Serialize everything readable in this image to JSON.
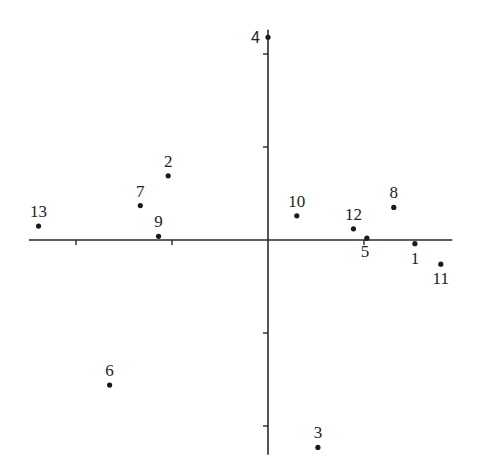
{
  "chart_data": {
    "type": "scatter",
    "title": "",
    "xlabel": "",
    "ylabel": "",
    "xlim": [
      -2.49,
      1.92
    ],
    "ylim": [
      -2.31,
      2.26
    ],
    "x_ticks": [
      -2,
      -1,
      1
    ],
    "y_ticks": [
      -2,
      -1,
      1,
      2
    ],
    "tick_labels_shown": false,
    "grid": false,
    "legend": "none",
    "points": [
      {
        "label": "1",
        "x": 1.53,
        "y": -0.04,
        "label_pos": "below"
      },
      {
        "label": "2",
        "x": -1.04,
        "y": 0.69,
        "label_pos": "above"
      },
      {
        "label": "3",
        "x": 0.52,
        "y": -2.23,
        "label_pos": "above"
      },
      {
        "label": "4",
        "x": 0.0,
        "y": 2.18,
        "label_pos": "left"
      },
      {
        "label": "5",
        "x": 1.03,
        "y": 0.02,
        "label_pos": "below-left"
      },
      {
        "label": "6",
        "x": -1.65,
        "y": -1.56,
        "label_pos": "above"
      },
      {
        "label": "7",
        "x": -1.33,
        "y": 0.37,
        "label_pos": "above"
      },
      {
        "label": "8",
        "x": 1.31,
        "y": 0.35,
        "label_pos": "above"
      },
      {
        "label": "9",
        "x": -1.14,
        "y": 0.04,
        "label_pos": "above"
      },
      {
        "label": "10",
        "x": 0.3,
        "y": 0.26,
        "label_pos": "above"
      },
      {
        "label": "11",
        "x": 1.8,
        "y": -0.26,
        "label_pos": "below"
      },
      {
        "label": "12",
        "x": 0.89,
        "y": 0.12,
        "label_pos": "above"
      },
      {
        "label": "13",
        "x": -2.39,
        "y": 0.15,
        "label_pos": "above"
      }
    ]
  }
}
